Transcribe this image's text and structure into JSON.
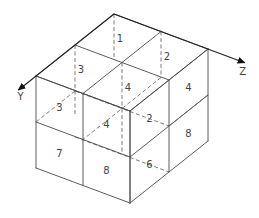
{
  "diagram": {
    "axes": [
      {
        "name": "Y",
        "label": "Y"
      },
      {
        "name": "Z",
        "label": "Z"
      }
    ],
    "cells": [
      {
        "id": 1,
        "label": "1",
        "face": "top",
        "grid": [
          0.5,
          0.5
        ]
      },
      {
        "id": 2,
        "label": "2",
        "face": "top",
        "grid": [
          0.5,
          1.5
        ]
      },
      {
        "id": 3,
        "label": "3",
        "face": "top",
        "grid": [
          1.5,
          0.5
        ]
      },
      {
        "id": 4,
        "label": "4",
        "face": "top",
        "grid": [
          1.5,
          1.5
        ]
      },
      {
        "id": 5,
        "label": "3",
        "face": "left",
        "grid": [
          0.5,
          0.5
        ]
      },
      {
        "id": 6,
        "label": "4",
        "face": "left",
        "grid": [
          1.5,
          0.5
        ]
      },
      {
        "id": 7,
        "label": "7",
        "face": "left",
        "grid": [
          0.5,
          1.5
        ]
      },
      {
        "id": 8,
        "label": "8",
        "face": "left",
        "grid": [
          1.5,
          1.5
        ]
      },
      {
        "id": 9,
        "label": "4",
        "face": "right",
        "grid": [
          0.5,
          0.5
        ]
      },
      {
        "id": 10,
        "label": "2",
        "face": "right",
        "grid": [
          1.5,
          0.5
        ]
      },
      {
        "id": 11,
        "label": "8",
        "face": "right",
        "grid": [
          0.5,
          1.5
        ]
      },
      {
        "id": 12,
        "label": "6",
        "face": "right",
        "grid": [
          1.5,
          1.5
        ]
      }
    ]
  }
}
